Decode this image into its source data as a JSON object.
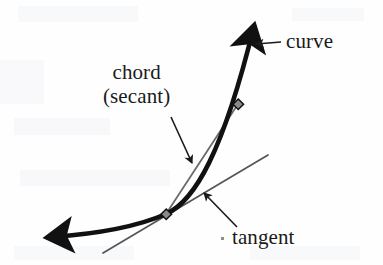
{
  "figure": {
    "background_color": "#fefeff",
    "labels": {
      "curve": "curve",
      "chord": "chord",
      "secant": "(secant)",
      "tangent": "tangent"
    },
    "colors": {
      "curve_stroke": "#111111",
      "chord_stroke": "#6b6b6b",
      "tangent_stroke": "#555555",
      "leader_stroke": "#1a1a1a",
      "point_fill": "#7a7a7a",
      "point_stroke": "#111111",
      "text": "#1a1a1a"
    },
    "geometry": {
      "curve_path": "M 42,238 C 90,235 132,229 166,214 C 196,200 224,150 258,18",
      "curve_width": 4.6,
      "curve_arrow_start": {
        "x": 42,
        "y": 238
      },
      "curve_arrow_end": {
        "x": 258,
        "y": 14
      },
      "chord_line": {
        "x1": 166,
        "y1": 214,
        "x2": 238,
        "y2": 104
      },
      "chord_width": 1.6,
      "tangent_line": {
        "x1": 103,
        "y1": 253,
        "x2": 268,
        "y2": 155
      },
      "tangent_width": 1.6,
      "points": [
        {
          "name": "lower-tangency-point",
          "x": 166,
          "y": 214,
          "size": 7
        },
        {
          "name": "upper-secant-point",
          "x": 238,
          "y": 104,
          "size": 7
        }
      ],
      "leader_curve": {
        "x1": 281,
        "y1": 42,
        "x2": 253,
        "y2": 44
      },
      "leader_chord": {
        "x1": 172,
        "y1": 119,
        "x2": 193,
        "y2": 166
      },
      "leader_tangent": {
        "x1": 236,
        "y1": 226,
        "x2": 202,
        "y2": 191
      }
    }
  }
}
